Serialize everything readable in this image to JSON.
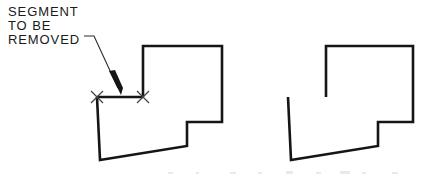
{
  "figure": {
    "title": "Segment To Be Removed",
    "background_color": "#ffffff",
    "line_color": "#151515",
    "leader_color": "#2a2a2a",
    "xmark_color": "#444444",
    "line_width": 2.6,
    "canvas": {
      "width": 422,
      "height": 175
    }
  },
  "annotation": {
    "lines": [
      {
        "text": "SEGMENT",
        "x": 8,
        "y": 16
      },
      {
        "text": "TO BE",
        "x": 8,
        "y": 30
      },
      {
        "text": "REMOVED",
        "x": 8,
        "y": 44
      }
    ],
    "full_text": "SEGMENT TO BE REMOVED",
    "font_size_px": 13,
    "leader": {
      "label": "leader-line",
      "points": "84,36 94,36 118,88",
      "arrow_tip": {
        "x": 121,
        "y": 95
      },
      "arrow_polygon": "121,95 109,71 115,70 123,88"
    }
  },
  "markers": {
    "label": "segment-endpoint-x-marks",
    "size": 7,
    "points": [
      {
        "name": "x-mark-left",
        "x": 97,
        "y": 97
      },
      {
        "name": "x-mark-right",
        "x": 143,
        "y": 97
      }
    ]
  },
  "shapes": {
    "before": {
      "label": "Before — outline with segment present",
      "name": "shape-before",
      "outline_path": "M 143,97 L 143,46 L 222,46 L 222,122 L 187,122 L 187,146 L 100,160 L 97,97",
      "removable_segment": {
        "label": "segment-to-be-removed",
        "from": {
          "x": 97,
          "y": 97
        },
        "to": {
          "x": 143,
          "y": 97
        }
      },
      "vertices": [
        {
          "x": 97,
          "y": 97
        },
        {
          "x": 143,
          "y": 97
        },
        {
          "x": 143,
          "y": 46
        },
        {
          "x": 222,
          "y": 46
        },
        {
          "x": 222,
          "y": 122
        },
        {
          "x": 187,
          "y": 122
        },
        {
          "x": 187,
          "y": 146
        },
        {
          "x": 100,
          "y": 160
        }
      ]
    },
    "after": {
      "label": "After — outline with segment removed",
      "name": "shape-after",
      "outline_path": "M 326,97 L 326,46 L 413,46 L 413,122 L 378,122 L 378,146 L 291,160 L 288,97",
      "open_endpoints": [
        {
          "name": "open-end-left",
          "x": 288,
          "y": 97
        },
        {
          "name": "open-end-right",
          "x": 326,
          "y": 97
        }
      ],
      "vertices": [
        {
          "x": 288,
          "y": 97
        },
        {
          "x": 326,
          "y": 97
        },
        {
          "x": 326,
          "y": 46
        },
        {
          "x": 413,
          "y": 46
        },
        {
          "x": 413,
          "y": 122
        },
        {
          "x": 378,
          "y": 122
        },
        {
          "x": 378,
          "y": 146
        },
        {
          "x": 291,
          "y": 160
        }
      ]
    }
  }
}
